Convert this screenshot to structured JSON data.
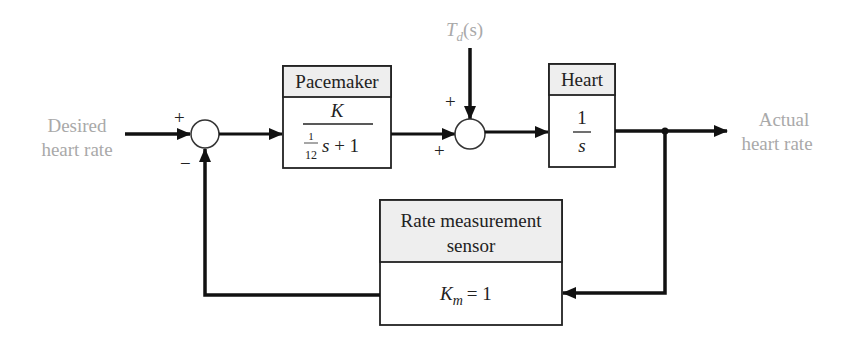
{
  "diagram": {
    "type": "block-diagram",
    "input": {
      "line1": "Desired",
      "line2": "heart rate"
    },
    "output": {
      "line1": "Actual",
      "line2": "heart rate"
    },
    "disturbance": {
      "symbol": "T",
      "subscript": "d",
      "arg": "(s)"
    },
    "summing_junction_1": {
      "plus_sign": "+",
      "minus_sign": "−"
    },
    "summing_junction_2": {
      "top_sign": "+",
      "left_sign": "+"
    },
    "pacemaker": {
      "title": "Pacemaker",
      "numerator": "K",
      "denominator_frac_num": "1",
      "denominator_frac_den": "12",
      "denominator_rest": "s + 1"
    },
    "heart": {
      "title": "Heart",
      "numerator": "1",
      "denominator": "s"
    },
    "sensor": {
      "title_line1": "Rate measurement",
      "title_line2": "sensor",
      "gain_symbol": "K",
      "gain_subscript": "m",
      "gain_value": "= 1"
    },
    "colors": {
      "line": "#111111",
      "header_fill": "#eeeeee",
      "label_gray": "#a9a9a9"
    }
  }
}
